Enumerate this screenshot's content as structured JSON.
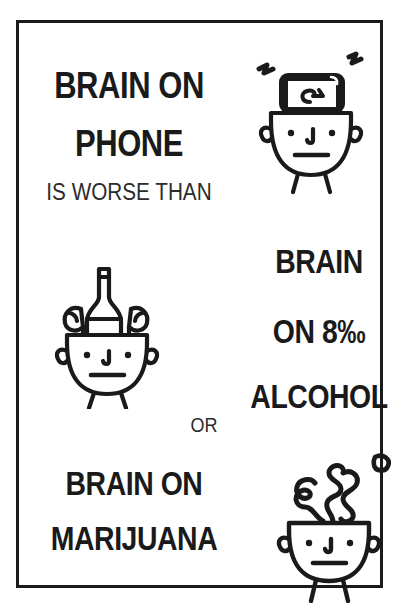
{
  "poster": {
    "background_color": "#ffffff",
    "ink_color": "#1a1a1a",
    "border_color": "#1a1a1a"
  },
  "sections": {
    "phone": {
      "headline_line1": "BRAIN ON",
      "headline_line2": "PHONE",
      "subline": "IS WORSE THAN",
      "illustration": "open-head-with-smartphone"
    },
    "alcohol": {
      "headline_line1": "BRAIN",
      "headline_line2": "ON 8‰",
      "headline_line3": "ALCOHOL",
      "illustration": "open-head-with-bottle-and-glasses"
    },
    "connector": {
      "label": "OR"
    },
    "marijuana": {
      "headline_line1": "BRAIN ON",
      "headline_line2": "MARIJUANA",
      "illustration": "open-head-with-smoke"
    }
  }
}
